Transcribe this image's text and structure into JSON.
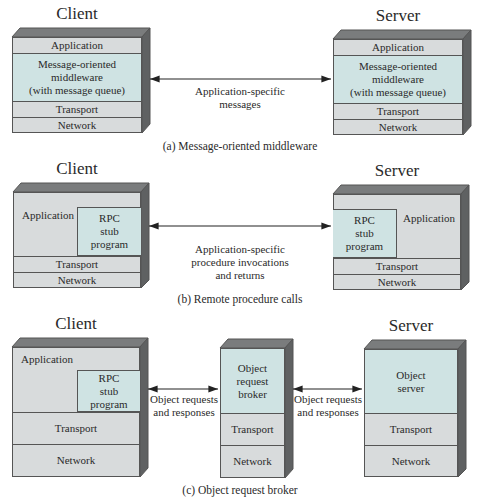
{
  "diagrams": {
    "a": {
      "client_heading": "Client",
      "server_heading": "Server",
      "client_layers": [
        "Application",
        "Message-oriented\nmiddleware\n(with message queue)",
        "Transport",
        "Network"
      ],
      "server_layers": [
        "Application",
        "Message-oriented\nmiddleware\n(with message queue)",
        "Transport",
        "Network"
      ],
      "arrow_label": "Application-specific\nmessages",
      "caption": "(a) Message-oriented middleware"
    },
    "b": {
      "client_heading": "Client",
      "server_heading": "Server",
      "client_application": "Application",
      "client_stub": "RPC\nstub\nprogram",
      "client_transport": "Transport",
      "client_network": "Network",
      "server_application": "Application",
      "server_stub": "RPC\nstub\nprogram",
      "server_transport": "Transport",
      "server_network": "Network",
      "arrow_label": "Application-specific\nprocedure invocations\nand returns",
      "caption": "(b) Remote procedure calls"
    },
    "c": {
      "client_heading": "Client",
      "server_heading": "Server",
      "client_application": "Application",
      "client_stub": "RPC\nstub\nprogram",
      "client_transport": "Transport",
      "client_network": "Network",
      "broker_top": "Object\nrequest\nbroker",
      "broker_transport": "Transport",
      "broker_network": "Network",
      "server_top": "Object\nserver",
      "server_transport": "Transport",
      "server_network": "Network",
      "arrow_label_left": "Object requests\nand responses",
      "arrow_label_right": "Object requests\nand responses",
      "caption": "(c) Object request broker"
    }
  },
  "colors": {
    "layer_gray": "#d8dbdc",
    "layer_teal": "#cfe3e3",
    "top_face": "#7a7c7d",
    "side_face": "#5f6162",
    "outline": "#555555"
  }
}
